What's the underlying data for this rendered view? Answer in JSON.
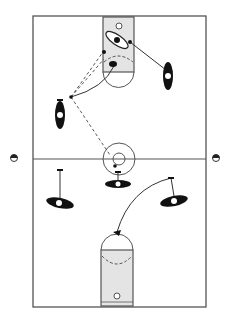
{
  "diagram": {
    "type": "basketball-play-diagram",
    "orientation": "vertical-full-court",
    "colors": {
      "background": "#ffffff",
      "court_line": "#555555",
      "lane_fill": "#e4e4e4",
      "player": "#111111",
      "label_bg": "#ffffff"
    },
    "court": {
      "x": 33,
      "y": 16,
      "width": 173,
      "height": 291,
      "midline_y": 159
    },
    "side_markers": [
      {
        "id": "left-side-marker",
        "x": 14,
        "y": 158
      },
      {
        "id": "right-side-marker",
        "x": 216,
        "y": 158
      }
    ],
    "players": [
      {
        "id": "player-right-wing-top",
        "cx": 168,
        "cy": 76,
        "rx": 5,
        "ry": 14,
        "rotate": 0
      },
      {
        "id": "player-left-wing-top",
        "cx": 60,
        "cy": 115,
        "rx": 5,
        "ry": 14,
        "rotate": 0
      },
      {
        "id": "player-center-circle",
        "cx": 118,
        "cy": 184,
        "rx": 13,
        "ry": 4,
        "rotate": 0
      },
      {
        "id": "player-left-bottom",
        "cx": 60,
        "cy": 203,
        "rx": 14,
        "ry": 5,
        "rotate": 12
      },
      {
        "id": "player-right-bottom",
        "cx": 174,
        "cy": 201,
        "rx": 14,
        "ry": 5,
        "rotate": -12
      }
    ],
    "paint_player": {
      "id": "player-in-paint",
      "cx": 117,
      "cy": 40,
      "rx": 13,
      "ry": 5,
      "rotate": 35
    }
  }
}
